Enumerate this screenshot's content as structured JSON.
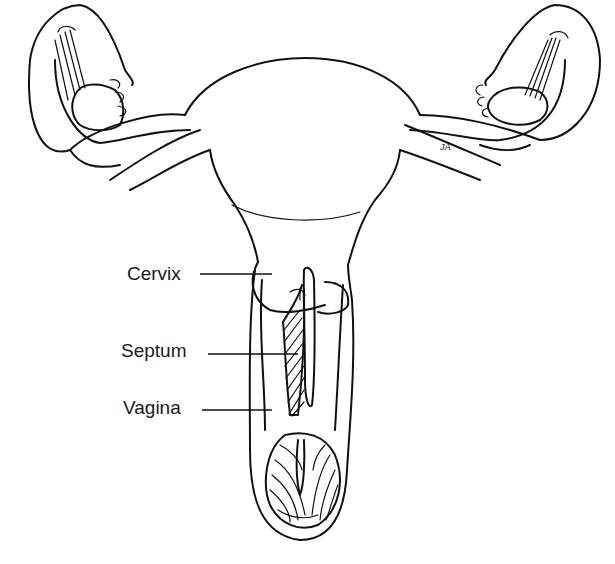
{
  "figure": {
    "background": "#ffffff",
    "line_color": "#111111",
    "labels": [
      {
        "id": "cervix",
        "text": "Cervix",
        "x": 127,
        "y": 264,
        "leader_to": [
          272,
          274
        ]
      },
      {
        "id": "septum",
        "text": "Septum",
        "x": 121,
        "y": 341,
        "leader_to": [
          298,
          354
        ]
      },
      {
        "id": "vagina",
        "text": "Vagina",
        "x": 123,
        "y": 398,
        "leader_to": [
          272,
          410
        ]
      }
    ],
    "signature": "JA"
  }
}
